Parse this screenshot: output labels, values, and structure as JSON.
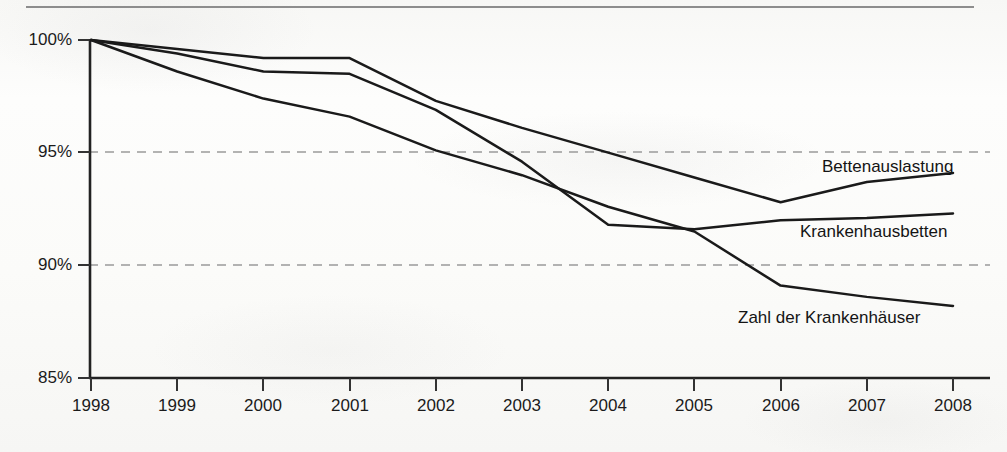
{
  "chart_data": {
    "type": "line",
    "title": "",
    "subtitle": "",
    "xlabel": "",
    "ylabel": "",
    "x": [
      1998,
      1999,
      2000,
      2001,
      2002,
      2003,
      2004,
      2005,
      2006,
      2007,
      2008
    ],
    "categories": [
      "1998",
      "1999",
      "2000",
      "2001",
      "2002",
      "2003",
      "2004",
      "2005",
      "2006",
      "2007",
      "2008"
    ],
    "xtick_labels": [
      "1998",
      "1999",
      "2000",
      "2001",
      "2002",
      "2003",
      "2004",
      "2005",
      "2006",
      "2007",
      "2008"
    ],
    "ytick_labels": [
      "85%",
      "90%",
      "95%",
      "100%"
    ],
    "ytick_values": [
      85,
      90,
      95,
      100
    ],
    "ylim": [
      85,
      100
    ],
    "xlim": [
      1998,
      2008
    ],
    "grid": "horizontal-dashed",
    "gridlines_at": [
      90,
      95
    ],
    "legend_position": "inline-right-of-line-ends",
    "units": "percent of 1998 value (index, 1998 = 100%)",
    "series": [
      {
        "name": "Bettenauslastung",
        "label": "Bettenauslastung",
        "color": "#1a1a1a",
        "values": [
          100.0,
          99.6,
          99.2,
          99.2,
          97.3,
          96.1,
          95.0,
          93.9,
          92.8,
          93.7,
          94.1
        ]
      },
      {
        "name": "Krankenhausbetten",
        "label": "Krankenhausbetten",
        "color": "#1a1a1a",
        "values": [
          100.0,
          99.4,
          98.6,
          98.5,
          96.9,
          94.6,
          91.8,
          91.6,
          92.0,
          92.1,
          92.3
        ]
      },
      {
        "name": "Zahl der Krankenhäuser",
        "label": "Zahl der Krankenhäuser",
        "color": "#1a1a1a",
        "values": [
          100.0,
          98.6,
          97.4,
          96.6,
          95.1,
          94.0,
          92.6,
          91.5,
          89.1,
          88.6,
          88.2
        ]
      }
    ]
  },
  "annotations": {
    "series_label_1": "Bettenauslastung",
    "series_label_2": "Krankenhausbetten",
    "series_label_3": "Zahl der Krankenhäuser"
  }
}
